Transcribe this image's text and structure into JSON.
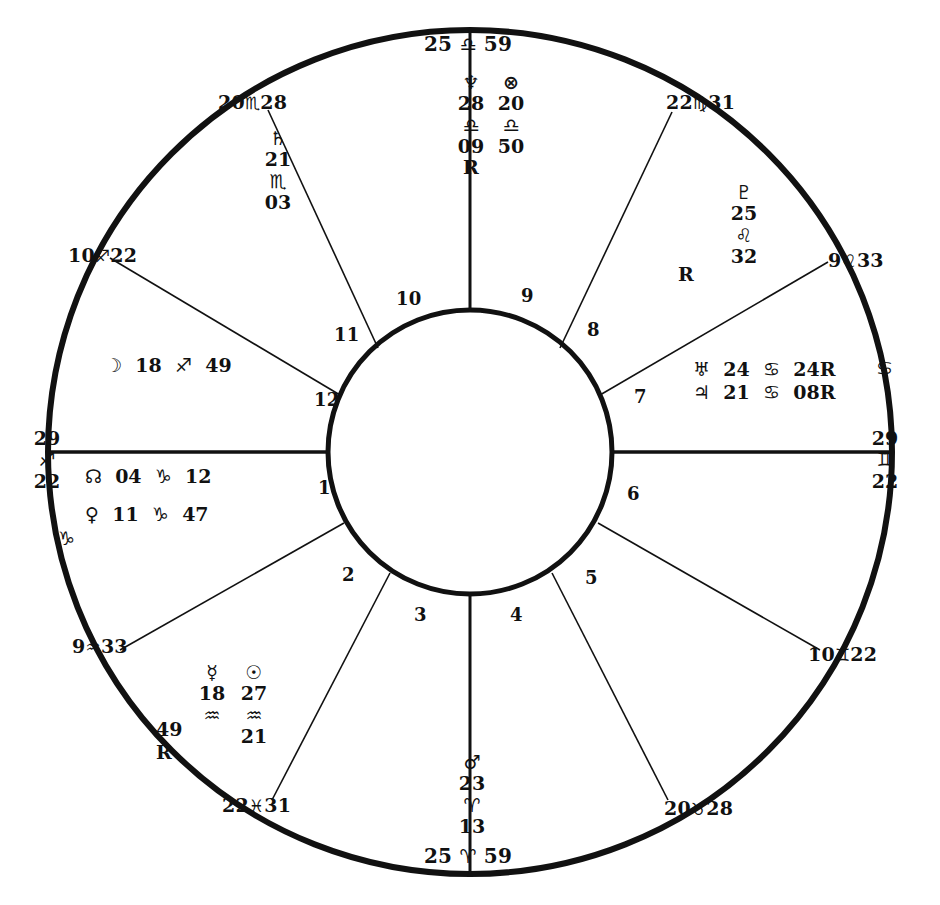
{
  "chart": {
    "type": "astrological-natal-wheel",
    "angles": {
      "mc": {
        "degree": "25",
        "sign_glyph": "♎",
        "sign_name": "Libra",
        "minute": "59",
        "text": "25 ♎ 59"
      },
      "ic": {
        "degree": "25",
        "sign_glyph": "♈",
        "sign_name": "Aries",
        "minute": "59",
        "text": "25 ♈ 59"
      },
      "asc": {
        "degree": "29",
        "sign_glyph": "♐",
        "sign_name": "Sagittarius",
        "minute": "22"
      },
      "dsc": {
        "degree": "29",
        "sign_glyph": "♊",
        "sign_name": "Gemini",
        "minute": "22"
      }
    },
    "edge_sign_glyphs": [
      {
        "glyph": "♑",
        "sign_name": "Capricorn",
        "x": 58,
        "y": 528
      },
      {
        "glyph": "♋",
        "sign_name": "Cancer",
        "x": 876,
        "y": 370
      }
    ],
    "cusps": [
      {
        "house": 11,
        "degree": "20",
        "sign_glyph": "♏",
        "sign_name": "Scorpio",
        "minute": "28",
        "x": 218,
        "y": 92
      },
      {
        "house": 12,
        "degree": "10",
        "sign_glyph": "♐",
        "sign_name": "Sagittarius",
        "minute": "22",
        "x": 68,
        "y": 245
      },
      {
        "house": 2,
        "degree": "9",
        "sign_glyph": "♒",
        "sign_name": "Aquarius",
        "minute": "33",
        "x": 72,
        "y": 636
      },
      {
        "house": 3,
        "degree": "22",
        "sign_glyph": "♓",
        "sign_name": "Pisces",
        "minute": "31",
        "x": 222,
        "y": 795
      },
      {
        "house": 5,
        "degree": "20",
        "sign_glyph": "♉",
        "sign_name": "Taurus",
        "minute": "28",
        "x": 664,
        "y": 798
      },
      {
        "house": 6,
        "degree": "10",
        "sign_glyph": "♊",
        "sign_name": "Gemini",
        "minute": "22",
        "x": 808,
        "y": 644
      },
      {
        "house": 8,
        "degree": "9",
        "sign_glyph": "♌",
        "sign_name": "Leo",
        "minute": "33",
        "x": 828,
        "y": 250
      },
      {
        "house": 9,
        "degree": "22",
        "sign_glyph": "♍",
        "sign_name": "Virgo",
        "minute": "31",
        "x": 666,
        "y": 92
      }
    ],
    "house_numbers": [
      {
        "n": "1",
        "x": 318,
        "y": 478
      },
      {
        "n": "2",
        "x": 342,
        "y": 565
      },
      {
        "n": "3",
        "x": 414,
        "y": 605
      },
      {
        "n": "4",
        "x": 510,
        "y": 605
      },
      {
        "n": "5",
        "x": 585,
        "y": 568
      },
      {
        "n": "6",
        "x": 627,
        "y": 484
      },
      {
        "n": "7",
        "x": 634,
        "y": 387
      },
      {
        "n": "8",
        "x": 587,
        "y": 320
      },
      {
        "n": "9",
        "x": 521,
        "y": 286
      },
      {
        "n": "10",
        "x": 396,
        "y": 289
      },
      {
        "n": "11",
        "x": 334,
        "y": 325
      },
      {
        "n": "12",
        "x": 314,
        "y": 390
      }
    ],
    "planets": [
      {
        "name": "Neptune",
        "glyph": "♆",
        "degree": "28",
        "sign_glyph": "♎",
        "sign_name": "Libra",
        "minute": "09",
        "retrograde": "R",
        "layout": "stacked",
        "x": 449,
        "y": 72
      },
      {
        "name": "Part of Fortune",
        "glyph": "⊗",
        "degree": "20",
        "sign_glyph": "♎",
        "sign_name": "Libra",
        "minute": "50",
        "retrograde": "",
        "layout": "stacked",
        "x": 489,
        "y": 72
      },
      {
        "name": "Saturn",
        "glyph": "♄",
        "degree": "21",
        "sign_glyph": "♏",
        "sign_name": "Scorpio",
        "minute": "03",
        "retrograde": "",
        "layout": "stacked",
        "x": 256,
        "y": 128
      },
      {
        "name": "Pluto",
        "glyph": "♇",
        "degree": "25",
        "sign_glyph": "♌",
        "sign_name": "Leo",
        "minute": "32",
        "retrograde": "R",
        "layout": "stacked-r-left",
        "x": 722,
        "y": 182
      },
      {
        "name": "Moon",
        "glyph": "☽",
        "degree": "18",
        "sign_glyph": "♐",
        "sign_name": "Sagittarius",
        "minute": "49",
        "retrograde": "",
        "layout": "row",
        "x": 105,
        "y": 354
      },
      {
        "name": "North Node",
        "glyph": "☊",
        "degree": "04",
        "sign_glyph": "♑",
        "sign_name": "Capricorn",
        "minute": "12",
        "retrograde": "",
        "layout": "row",
        "x": 85,
        "y": 465
      },
      {
        "name": "Venus",
        "glyph": "♀",
        "degree": "11",
        "sign_glyph": "♑",
        "sign_name": "Capricorn",
        "minute": "47",
        "retrograde": "",
        "layout": "row",
        "x": 85,
        "y": 503
      },
      {
        "name": "Uranus",
        "glyph": "♅",
        "degree": "24",
        "sign_glyph": "♋",
        "sign_name": "Cancer",
        "minute": "24",
        "retrograde": "R",
        "layout": "row",
        "x": 693,
        "y": 358
      },
      {
        "name": "Jupiter",
        "glyph": "♃",
        "degree": "21",
        "sign_glyph": "♋",
        "sign_name": "Cancer",
        "minute": "08",
        "retrograde": "R",
        "layout": "row",
        "x": 693,
        "y": 381
      },
      {
        "name": "Mercury",
        "glyph": "☿",
        "degree": "18",
        "sign_glyph": "♒",
        "sign_name": "Aquarius",
        "minute": "49",
        "retrograde": "R",
        "layout": "stacked-r-left",
        "x": 190,
        "y": 662
      },
      {
        "name": "Sun",
        "glyph": "☉",
        "degree": "27",
        "sign_glyph": "♒",
        "sign_name": "Aquarius",
        "minute": "21",
        "retrograde": "",
        "layout": "stacked",
        "x": 232,
        "y": 662
      },
      {
        "name": "Mars",
        "glyph": "♂",
        "degree": "23",
        "sign_glyph": "♈",
        "sign_name": "Aries",
        "minute": "13",
        "retrograde": "",
        "layout": "stacked",
        "x": 450,
        "y": 752
      }
    ],
    "colors": {
      "ink": "#111111",
      "background": "#ffffff"
    }
  }
}
